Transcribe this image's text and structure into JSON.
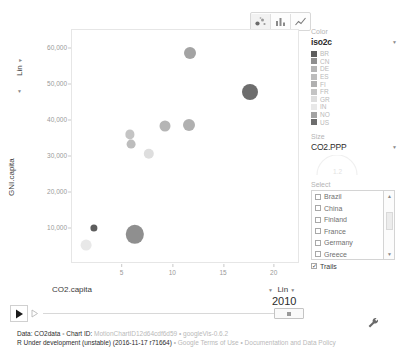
{
  "chart_data": {
    "type": "scatter",
    "title": "",
    "xlabel": "CO2.capita",
    "ylabel": "GNI.capita",
    "xlim": [
      0,
      22.5
    ],
    "ylim": [
      0,
      65000
    ],
    "grid": false,
    "legend_position": "right",
    "xticks": [
      "5",
      "10",
      "15",
      "20"
    ],
    "xtick_values": [
      5,
      10,
      15,
      20
    ],
    "yticks": [
      "60,000",
      "50,000",
      "40,000",
      "30,000",
      "20,000",
      "10,000"
    ],
    "ytick_values": [
      60000,
      50000,
      40000,
      30000,
      20000,
      10000
    ],
    "size_field": "CO2.PPP",
    "color_field": "iso2c",
    "year": "2010",
    "points": [
      {
        "iso2c": "NO",
        "name": "Norway",
        "x": 11.6,
        "y": 58500,
        "r": 6.0,
        "color": "#a3a3a3"
      },
      {
        "iso2c": "US",
        "name": "United States",
        "x": 17.6,
        "y": 47800,
        "r": 8.0,
        "color": "#6d6d6d"
      },
      {
        "iso2c": "FI",
        "name": "Finland",
        "x": 11.5,
        "y": 38700,
        "r": 6.0,
        "color": "#b0b0b0"
      },
      {
        "iso2c": "DE",
        "name": "Germany",
        "x": 9.2,
        "y": 38300,
        "r": 5.5,
        "color": "#b5b5b5"
      },
      {
        "iso2c": "FR",
        "name": "France",
        "x": 5.7,
        "y": 36000,
        "r": 4.6,
        "color": "#c4c4c4"
      },
      {
        "iso2c": "ES",
        "name": "Spain",
        "x": 5.8,
        "y": 33200,
        "r": 4.4,
        "color": "#bdbdbd"
      },
      {
        "iso2c": "GR",
        "name": "Greece",
        "x": 7.6,
        "y": 30600,
        "r": 5.2,
        "color": "#dedede"
      },
      {
        "iso2c": "CN",
        "name": "China",
        "x": 6.2,
        "y": 8200,
        "r": 9.2,
        "color": "#8f8f8f"
      },
      {
        "iso2c": "BR",
        "name": "Brazil",
        "x": 2.2,
        "y": 10000,
        "r": 3.6,
        "color": "#5d5d5d"
      },
      {
        "iso2c": "IN",
        "name": "India",
        "x": 1.4,
        "y": 5200,
        "r": 5.4,
        "color": "#e8e8e8"
      }
    ]
  },
  "toolbar": {
    "chart_types": [
      {
        "id": "bubble",
        "icon": "scatter-chart-icon",
        "active": true
      },
      {
        "id": "bar",
        "icon": "bar-chart-icon",
        "active": false
      },
      {
        "id": "line",
        "icon": "line-chart-icon",
        "active": false
      }
    ]
  },
  "axes": {
    "y_title": "GNI.capita",
    "y_scale": "Lin",
    "x_title": "CO2.capita",
    "x_scale": "Lin"
  },
  "panel": {
    "color": {
      "section_label": "Color",
      "value": "iso2c",
      "items": [
        {
          "code": "BR",
          "swatch": "#5d5d5d"
        },
        {
          "code": "CN",
          "swatch": "#8f8f8f"
        },
        {
          "code": "DE",
          "swatch": "#b5b5b5"
        },
        {
          "code": "ES",
          "swatch": "#bdbdbd"
        },
        {
          "code": "FI",
          "swatch": "#b0b0b0"
        },
        {
          "code": "FR",
          "swatch": "#c4c4c4"
        },
        {
          "code": "GR",
          "swatch": "#dedede"
        },
        {
          "code": "IN",
          "swatch": "#e8e8e8"
        },
        {
          "code": "NO",
          "swatch": "#a3a3a3"
        },
        {
          "code": "US",
          "swatch": "#6d6d6d"
        }
      ]
    },
    "size": {
      "section_label": "Size",
      "value": "CO2.PPP",
      "gauge_value": "1.2"
    },
    "select": {
      "section_label": "Select",
      "items": [
        {
          "label": "Brazil",
          "checked": false
        },
        {
          "label": "China",
          "checked": false
        },
        {
          "label": "Finland",
          "checked": false
        },
        {
          "label": "France",
          "checked": false
        },
        {
          "label": "Germany",
          "checked": false
        },
        {
          "label": "Greece",
          "checked": false
        }
      ],
      "trails_label": "Trails",
      "trails_checked": true
    }
  },
  "playback": {
    "year": "2010",
    "play_icon": "play-icon",
    "speed_icon": "playback-speed-icon",
    "settings_icon": "wrench-icon"
  },
  "footer": {
    "line1": [
      {
        "text": "Data: CO2data",
        "muted": false
      },
      {
        "text": " • ",
        "muted": true
      },
      {
        "text": "Chart ID: ",
        "muted": false
      },
      {
        "text": "MotionChartID12d64cdf6d59",
        "muted": true
      },
      {
        "text": " • ",
        "muted": true
      },
      {
        "text": "googleVis-0.6.2",
        "muted": true
      }
    ],
    "line2": [
      {
        "text": "R Under development (unstable) (2016-11-17 r71664)",
        "muted": false
      },
      {
        "text": " • ",
        "muted": true
      },
      {
        "text": "Google Terms of Use",
        "muted": true
      },
      {
        "text": " • ",
        "muted": true
      },
      {
        "text": "Documentation and Data Policy",
        "muted": true
      }
    ]
  }
}
